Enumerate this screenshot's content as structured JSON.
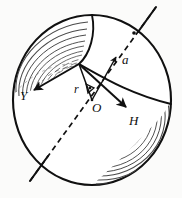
{
  "figure": {
    "type": "geometry-vector-diagram",
    "background_color": "#fbfbfa",
    "ink_color": "#101010",
    "shading_color": "#555555"
  },
  "sphere": {
    "name": "outer-sphere",
    "center": {
      "x": 92,
      "y": 100
    },
    "radius_x": 80,
    "radius_y": 86,
    "outline_width": 2.0
  },
  "labels": {
    "vector_y": "Y",
    "vector_a": "a",
    "vector_h": "H",
    "radius": "r",
    "center_point": "O",
    "angle": ""
  },
  "vectors": [
    {
      "id": "vector-y",
      "label": "Y",
      "from": {
        "x": 79,
        "y": 64
      },
      "to": {
        "x": 31,
        "y": 92
      },
      "arrowhead": "to",
      "label_pos": {
        "x": 20,
        "y": 98
      }
    },
    {
      "id": "vector-a",
      "label": "a",
      "from": {
        "x": 92,
        "y": 100
      },
      "to": {
        "x": 118,
        "y": 55
      },
      "arrowhead": "to",
      "label_pos": {
        "x": 124,
        "y": 62
      }
    },
    {
      "id": "vector-h",
      "label": "H",
      "from": {
        "x": 79,
        "y": 64
      },
      "to": {
        "x": 129,
        "y": 110
      },
      "arrowhead": "to",
      "label_pos": {
        "x": 130,
        "y": 124
      }
    },
    {
      "id": "radius-r",
      "label": "r",
      "from": {
        "x": 92,
        "y": 100
      },
      "to": {
        "x": 79,
        "y": 64
      },
      "arrowhead": "none",
      "label_pos": {
        "x": 78,
        "y": 92
      }
    }
  ],
  "axis": {
    "id": "rotation-axis",
    "style": "dashed",
    "from": {
      "x": 30,
      "y": 180
    },
    "to": {
      "x": 155,
      "y": 8
    },
    "dash_pattern": "5 4"
  },
  "curves": [
    {
      "id": "great-circle-equator",
      "style": "solid"
    },
    {
      "id": "meridian-terminator",
      "style": "solid"
    }
  ],
  "shading": {
    "regions": [
      {
        "id": "upper-left-hatch",
        "line_count": 11
      },
      {
        "id": "lower-right-hatch",
        "line_count": 13
      }
    ]
  },
  "annotations": {
    "angle_marker": {
      "at": {
        "x": 90,
        "y": 89
      },
      "symbol": "angle"
    },
    "center_dot": {
      "at": {
        "x": 92,
        "y": 100
      }
    },
    "surface_point_dot": {
      "at": {
        "x": 134,
        "y": 33
      }
    }
  }
}
